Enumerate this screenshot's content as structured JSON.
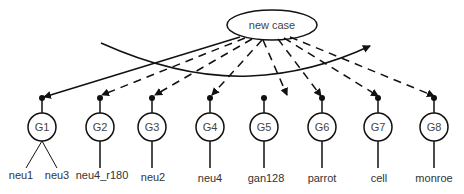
{
  "root": {
    "label": "new case"
  },
  "nodes": [
    {
      "id": "G1",
      "label": "G1",
      "edge": "solid",
      "leaves": [
        "neu1",
        "neu3"
      ]
    },
    {
      "id": "G2",
      "label": "G2",
      "edge": "dashed",
      "leaves": [
        "neu4_r180"
      ]
    },
    {
      "id": "G3",
      "label": "G3",
      "edge": "dashed",
      "leaves": [
        "neu2"
      ]
    },
    {
      "id": "G4",
      "label": "G4",
      "edge": "dashed",
      "leaves": [
        "neu4"
      ]
    },
    {
      "id": "G5",
      "label": "G5",
      "edge": "dashed",
      "leaves": [
        "gan128"
      ]
    },
    {
      "id": "G6",
      "label": "G6",
      "edge": "dashed",
      "leaves": [
        "parrot"
      ]
    },
    {
      "id": "G7",
      "label": "G7",
      "edge": "dashed",
      "leaves": [
        "cell"
      ]
    },
    {
      "id": "G8",
      "label": "G8",
      "edge": "dashed",
      "leaves": [
        "monroe"
      ]
    }
  ],
  "colors": {
    "stroke": "#111111",
    "text": "#444444",
    "background": "#ffffff"
  }
}
